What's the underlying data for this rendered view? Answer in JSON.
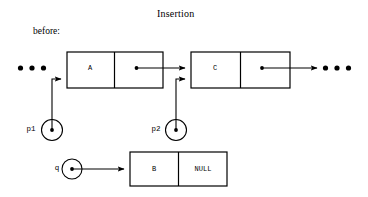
{
  "figure": {
    "title": "Insertion",
    "stage_label": "before:",
    "background_color": "#ffffff",
    "ink_color": "#000000"
  },
  "list": {
    "left_ellipsis": "• • •",
    "right_ellipsis": "• • •",
    "nodes": [
      {
        "id": "node-a",
        "data": "A",
        "next": "pointer"
      },
      {
        "id": "node-c",
        "data": "C",
        "next": "pointer"
      }
    ]
  },
  "new_node": {
    "id": "node-b",
    "data": "B",
    "next": "NULL"
  },
  "pointers": [
    {
      "id": "p1",
      "label": "p1",
      "target": "node-a"
    },
    {
      "id": "p2",
      "label": "p2",
      "target": "node-c"
    },
    {
      "id": "q",
      "label": "q",
      "target": "node-b"
    }
  ]
}
